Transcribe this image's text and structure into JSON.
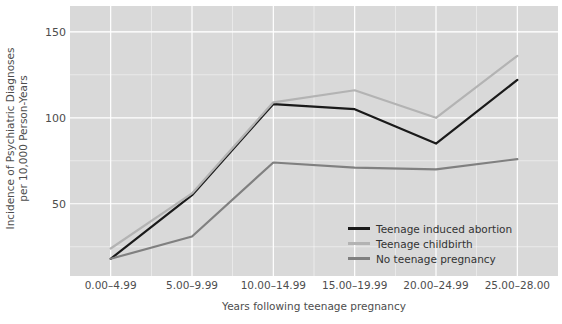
{
  "chart_data": {
    "type": "line",
    "title": "",
    "subtitle": "",
    "xlabel": "Years following teenage pregnancy",
    "ylabel_line1": "Incidence of Psychiatric Diagnoses",
    "ylabel_line2": "per 10,000 Person-Years",
    "categories": [
      "0.00–4.99",
      "5.00–9.99",
      "10.00–14.99",
      "15.00–19.99",
      "20.00–24.99",
      "25.00–28.00"
    ],
    "yticks": [
      50,
      100,
      150
    ],
    "ytick_labels": [
      "50",
      "100",
      "150"
    ],
    "ylim": [
      8,
      165
    ],
    "grid": true,
    "legend_position": "inside-bottom-right",
    "series": [
      {
        "name": "Teenage induced abortion",
        "color": "#1a1a1a",
        "values": [
          18,
          55,
          108,
          105,
          85,
          122
        ]
      },
      {
        "name": "Teenage childbirth",
        "color": "#b3b3b3",
        "values": [
          24,
          56,
          109,
          116,
          100,
          136
        ]
      },
      {
        "name": "No teenage pregnancy",
        "color": "#808080",
        "values": [
          18,
          31,
          74,
          71,
          70,
          76
        ]
      }
    ]
  },
  "panel": {
    "background_color": "#d9d9d9",
    "grid_color": "#ffffff"
  },
  "legend": {
    "items": [
      {
        "label": "Teenage induced abortion",
        "color": "#1a1a1a"
      },
      {
        "label": "Teenage childbirth",
        "color": "#b3b3b3"
      },
      {
        "label": "No teenage pregnancy",
        "color": "#808080"
      }
    ]
  }
}
